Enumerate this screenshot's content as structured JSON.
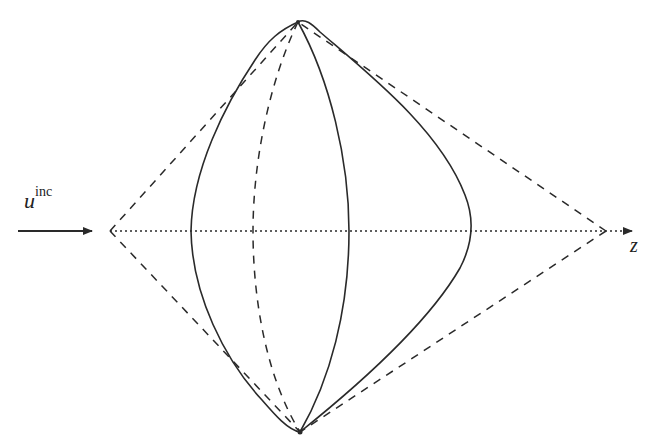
{
  "diagram": {
    "labels": {
      "incident_symbol": "u",
      "incident_superscript": "inc",
      "axis_label": "z"
    },
    "colors": {
      "stroke": "#2a2a2a",
      "background": "#ffffff"
    },
    "geometry": {
      "top_apex": [
        298,
        22
      ],
      "bottom_apex": [
        300,
        432
      ],
      "left_cone_vertex": [
        110,
        231
      ],
      "right_cone_vertex": [
        606,
        231
      ],
      "axis_start": [
        110,
        231
      ],
      "axis_end": [
        640,
        231
      ],
      "incident_arrow": {
        "from": [
          18,
          231
        ],
        "to": [
          90,
          231
        ]
      },
      "left_profile_extreme": [
        191,
        231
      ],
      "right_profile_extreme": [
        471,
        231
      ],
      "front_meridian_x": 349,
      "back_meridian_x": 253
    }
  }
}
